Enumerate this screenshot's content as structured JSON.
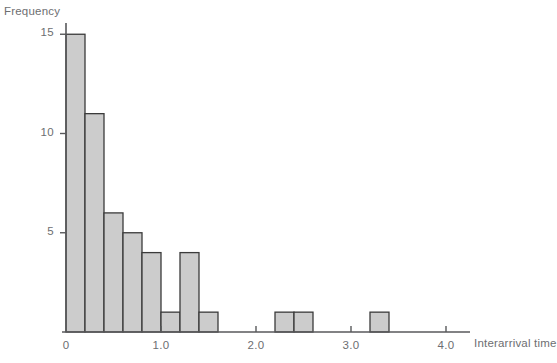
{
  "figure": {
    "background_color": "#ffffff",
    "axis_color": "#58595b",
    "text_color": "#6d6e71",
    "bar_fill": "#cccccc",
    "bar_stroke": "#3b3b3b"
  },
  "labels": {
    "y_axis_title": "Frequency",
    "x_axis_title": "Interarrival time"
  },
  "chart_data": {
    "type": "bar",
    "title": "",
    "xlabel": "Interarrival time",
    "ylabel": "Frequency",
    "grid": false,
    "legend": null,
    "xlim": [
      0,
      4.4
    ],
    "ylim": [
      0,
      15.7
    ],
    "xticks": [
      0,
      1.0,
      2.0,
      3.0,
      4.0
    ],
    "xtick_labels": [
      "0",
      "1.0",
      "2.0",
      "3.0",
      "4.0"
    ],
    "yticks": [
      5,
      10,
      15
    ],
    "ytick_labels": [
      "5",
      "10",
      "15"
    ],
    "bin_width": 0.2,
    "bins": [
      {
        "x0": 0.0,
        "x1": 0.2,
        "value": 15
      },
      {
        "x0": 0.2,
        "x1": 0.4,
        "value": 11
      },
      {
        "x0": 0.4,
        "x1": 0.6,
        "value": 6
      },
      {
        "x0": 0.6,
        "x1": 0.8,
        "value": 5
      },
      {
        "x0": 0.8,
        "x1": 1.0,
        "value": 4
      },
      {
        "x0": 1.0,
        "x1": 1.2,
        "value": 1
      },
      {
        "x0": 1.2,
        "x1": 1.4,
        "value": 4
      },
      {
        "x0": 1.4,
        "x1": 1.6,
        "value": 1
      },
      {
        "x0": 2.2,
        "x1": 2.4,
        "value": 1
      },
      {
        "x0": 2.4,
        "x1": 2.6,
        "value": 1
      },
      {
        "x0": 3.2,
        "x1": 3.4,
        "value": 1
      }
    ],
    "categories": [
      "0.0-0.2",
      "0.2-0.4",
      "0.4-0.6",
      "0.6-0.8",
      "0.8-1.0",
      "1.0-1.2",
      "1.2-1.4",
      "1.4-1.6",
      "2.2-2.4",
      "2.4-2.6",
      "3.2-3.4"
    ],
    "values": [
      15,
      11,
      6,
      5,
      4,
      1,
      4,
      1,
      1,
      1,
      1
    ]
  }
}
